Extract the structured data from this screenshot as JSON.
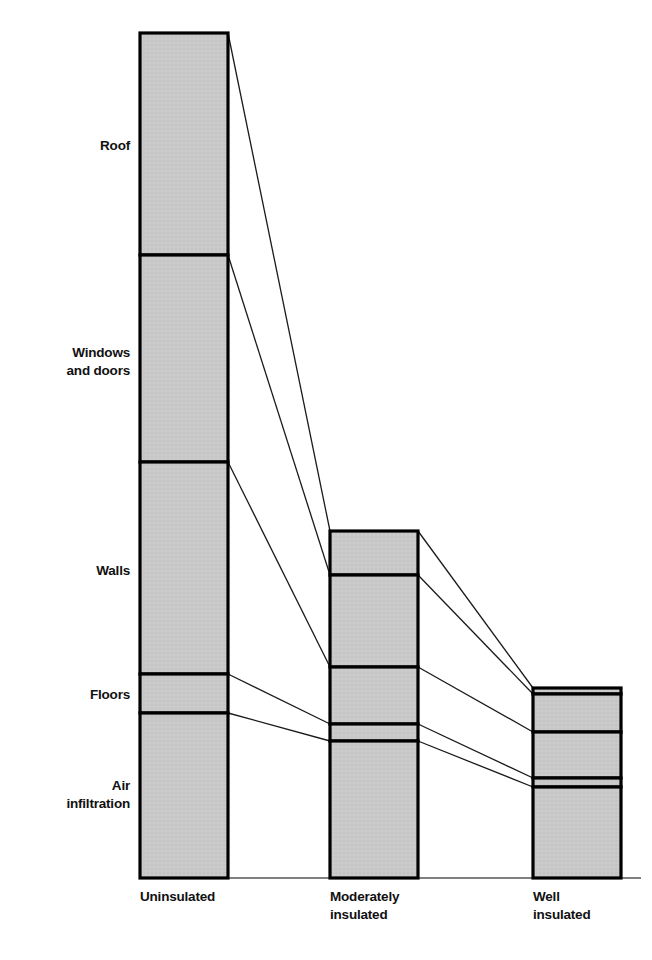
{
  "chart_data": {
    "type": "bar",
    "title": "",
    "subtitle": "",
    "xlabel": "",
    "ylabel": "",
    "stacked": true,
    "grid": false,
    "legend_position": "left-labels",
    "categories": [
      "Uninsulated",
      "Moderately insulated",
      "Well insulated"
    ],
    "category_labels_multiline": [
      [
        "Uninsulated"
      ],
      [
        "Moderately",
        "insulated"
      ],
      [
        "Well",
        "insulated"
      ]
    ],
    "segment_names": [
      "Roof",
      "Windows and doors",
      "Walls",
      "Floors",
      "Air infiltration"
    ],
    "segment_labels_multiline": [
      [
        "Roof"
      ],
      [
        "Windows",
        "and doors"
      ],
      [
        "Walls"
      ],
      [
        "Floors"
      ],
      [
        "Air",
        "infiltration"
      ]
    ],
    "ylim": [
      0,
      100
    ],
    "series": [
      {
        "name": "Roof",
        "values": [
          26.3,
          5.2,
          0.7
        ]
      },
      {
        "name": "Windows and doors",
        "values": [
          24.5,
          10.9,
          4.5
        ]
      },
      {
        "name": "Walls",
        "values": [
          25.1,
          6.7,
          5.4
        ]
      },
      {
        "name": "Floors",
        "values": [
          4.6,
          2.0,
          0.8
        ]
      },
      {
        "name": "Air infiltration",
        "values": [
          19.5,
          16.2,
          11.0
        ]
      }
    ],
    "totals": [
      100.0,
      41.0,
      22.4
    ],
    "units": "relative heat loss (%)"
  },
  "style": {
    "bar_fill": "#c9c9c9",
    "bar_stroke": "#000000",
    "connector_stroke": "#1a1a1a",
    "baseline_stroke": "#000000",
    "background": "#ffffff",
    "label_color": "#111111"
  },
  "geometry": {
    "baseline_y": 878,
    "bars": [
      {
        "x": 140,
        "width": 88,
        "top": 33,
        "boundaries": [
          33,
          255,
          462,
          674,
          713,
          878
        ]
      },
      {
        "x": 330,
        "width": 88,
        "top": 531,
        "boundaries": [
          531,
          575,
          667,
          724,
          741,
          878
        ]
      },
      {
        "x": 533,
        "width": 88,
        "top": 688,
        "boundaries": [
          688,
          694,
          732,
          778,
          787,
          878
        ]
      }
    ],
    "segment_label_anchors": [
      {
        "text_x": 130,
        "y": 150
      },
      {
        "text_x": 130,
        "y": 357
      },
      {
        "text_x": 130,
        "y": 575
      },
      {
        "text_x": 130,
        "y": 699
      },
      {
        "text_x": 130,
        "y": 790
      }
    ],
    "category_label_anchors": [
      {
        "x": 140,
        "y": 901
      },
      {
        "x": 330,
        "y": 901
      },
      {
        "x": 533,
        "y": 901
      }
    ]
  }
}
